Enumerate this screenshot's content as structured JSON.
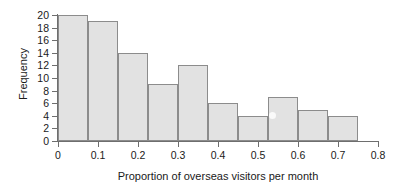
{
  "chart_data": {
    "type": "bar",
    "title": "",
    "subtitle": "",
    "xlabel": "Proportion of overseas visitors per month",
    "ylabel": "Frequency",
    "xlim": [
      0,
      0.8
    ],
    "ylim": [
      0,
      20
    ],
    "grid": false,
    "legend": null,
    "bin_width": 0.075,
    "bin_edges": [
      0,
      0.075,
      0.15,
      0.225,
      0.3,
      0.375,
      0.45,
      0.525,
      0.6,
      0.675,
      0.75
    ],
    "categories": [
      "0.000-0.075",
      "0.075-0.150",
      "0.150-0.225",
      "0.225-0.300",
      "0.300-0.375",
      "0.375-0.450",
      "0.450-0.525",
      "0.525-0.600",
      "0.600-0.675",
      "0.675-0.750"
    ],
    "values": [
      20,
      19,
      14,
      9,
      12,
      6,
      4,
      7,
      5,
      4
    ],
    "xticks": [
      0,
      0.1,
      0.2,
      0.3,
      0.4,
      0.5,
      0.6,
      0.7,
      0.8
    ],
    "xtick_labels": [
      "0",
      "0.1",
      "0.2",
      "0.3",
      "0.4",
      "0.5",
      "0.6",
      "0.7",
      "0.8"
    ],
    "yticks": [
      0,
      2,
      4,
      6,
      8,
      10,
      12,
      14,
      16,
      18,
      20
    ],
    "ytick_labels": [
      "0",
      "2",
      "4",
      "6",
      "8",
      "10",
      "12",
      "14",
      "16",
      "18",
      "20"
    ],
    "colors": {
      "bar_fill": "#e2e2e2",
      "bar_edge": "#8c8c8c",
      "axis": "#6e6e6e",
      "text": "#1a1a1a",
      "background": "#ffffff"
    }
  }
}
